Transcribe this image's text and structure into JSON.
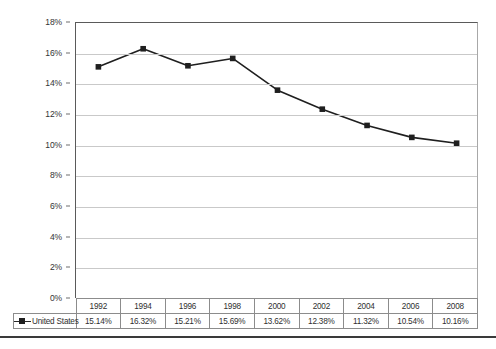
{
  "chart_data": {
    "type": "line",
    "title": "",
    "subtitle": "",
    "xlabel": "",
    "ylabel": "",
    "categories": [
      "1992",
      "1994",
      "1996",
      "1998",
      "2000",
      "2002",
      "2004",
      "2006",
      "2008"
    ],
    "series": [
      {
        "name": "United States",
        "values": [
          15.14,
          16.32,
          15.21,
          15.69,
          13.62,
          12.38,
          11.32,
          10.54,
          10.16
        ],
        "labels": [
          "15.14%",
          "16.32%",
          "15.21%",
          "15.69%",
          "13.62%",
          "12.38%",
          "11.32%",
          "10.54%",
          "10.16%"
        ],
        "marker": "square",
        "color": "#1f1f1f"
      }
    ],
    "ylim": [
      0,
      18
    ],
    "ytick_step": 2,
    "ytick_labels": [
      "18%",
      "16%",
      "14%",
      "12%",
      "10%",
      "8%",
      "6%",
      "4%",
      "2%",
      "0%"
    ],
    "ytick_values": [
      18,
      16,
      14,
      12,
      10,
      8,
      6,
      4,
      2,
      0
    ],
    "grid": true,
    "grid_axis": "y",
    "legend_position": "data-table-left",
    "has_data_table": true
  },
  "table": {
    "header_row": [
      "1992",
      "1994",
      "1996",
      "1998",
      "2000",
      "2002",
      "2004",
      "2006",
      "2008"
    ],
    "legend_corner_label": "",
    "rows": [
      {
        "label": "United States",
        "marker_icon": "line-square-marker-icon",
        "values": [
          "15.14%",
          "16.32%",
          "15.21%",
          "15.69%",
          "13.62%",
          "12.38%",
          "11.32%",
          "10.54%",
          "10.16%"
        ]
      }
    ]
  },
  "colors": {
    "series_line": "#1f1f1f",
    "marker": "#1f1f1f",
    "gridline": "#c9c9c9",
    "axis": "#5a5a5a",
    "table_border": "#8c8c8c",
    "background": "#ffffff",
    "bottom_rule": "#3a3a3a"
  }
}
